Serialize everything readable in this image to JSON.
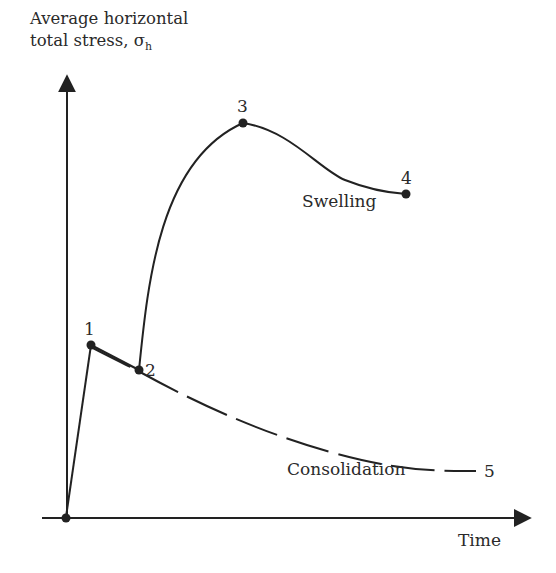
{
  "figure": {
    "y_axis_label_line1": "Average horizontal",
    "y_axis_label_line2": "total stress, ",
    "y_axis_symbol": "σ",
    "y_axis_symbol_sub": "h",
    "x_axis_label": "Time",
    "curve_labels": {
      "swelling": "Swelling",
      "consolidation": "Consolidation"
    },
    "points": [
      {
        "id": "1",
        "label": "1"
      },
      {
        "id": "2",
        "label": "2"
      },
      {
        "id": "3",
        "label": "3"
      },
      {
        "id": "4",
        "label": "4"
      },
      {
        "id": "5",
        "label": "5"
      }
    ],
    "colors": {
      "line": "#222222",
      "text": "#2a2a2a",
      "background": "#ffffff"
    }
  }
}
